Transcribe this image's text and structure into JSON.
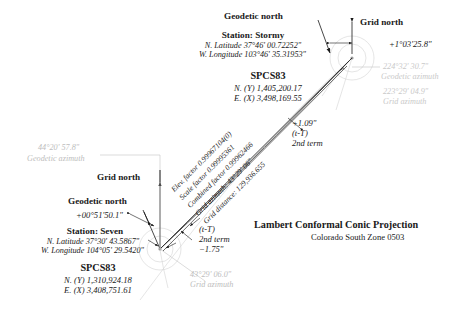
{
  "figure": {
    "title": "Lambert Conformal Conic Projection",
    "subtitle": "Colorado South Zone 0503"
  },
  "stormy": {
    "geodetic_north_label": "Geodetic north",
    "grid_north_label": "Grid north",
    "station_label": "Station: Stormy",
    "latitude": "N. Latitude 37°46' 00.72252\"",
    "longitude": "W. Longitude 103°46' 35.31953\"",
    "spcs_label": "SPCS83",
    "northing": "N. (Y) 1,405,200.17",
    "easting": "E. (X) 3,498,169.55",
    "convergence": "+1°03'25.8\"",
    "geodetic_azimuth_value": "224°32' 30.7\"",
    "geodetic_azimuth_label": "Geodetic azimuth",
    "grid_azimuth_value": "223°29' 04.9\"",
    "grid_azimuth_label": "Grid azimuth"
  },
  "seven": {
    "geodetic_north_label": "Geodetic north",
    "grid_north_label": "Grid north",
    "station_label": "Station: Seven",
    "latitude": "N. Latitude 37°30' 43.5867\"",
    "longitude": "W. Longitude 104°05' 29.5420\"",
    "spcs_label": "SPCS83",
    "northing": "N. (Y) 1,310,924.18",
    "easting": "E. (X) 3,408,751.61",
    "convergence": "+00°51'50.1\"",
    "geodetic_azimuth_value": "44°20' 57.8\"",
    "geodetic_azimuth_label": "Geodetic azimuth",
    "grid_azimuth_value": "43°29' 06.0\"",
    "grid_azimuth_label": "Grid azimuth"
  },
  "line_data": {
    "elev_factor": "Elev. factor 0.99967104(0)",
    "scale_factor": "Scale factor 0.99995361",
    "combined_factor": "Combined factor 0.99962466",
    "grid_azimuth": "Grid azimuth: 43°29' 06\"",
    "grid_distance": "Grid distance: 129,936.655"
  },
  "tT_stormy": {
    "value": "+1.09\"",
    "name": "(t-T)",
    "term": "2nd term"
  },
  "tT_seven": {
    "name": "(t-T)",
    "term": "2nd term",
    "value": "−1.75\""
  }
}
